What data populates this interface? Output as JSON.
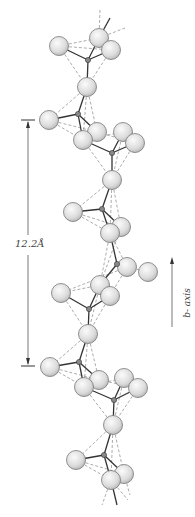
{
  "figure": {
    "scale_bar": {
      "label": "12.2Å",
      "x": 28,
      "y_top": 120,
      "y_bottom": 366
    },
    "axis": {
      "label": "b- axis",
      "x": 172,
      "y_tip": 257,
      "y_tail": 327
    },
    "colors": {
      "atom_fill": "#e2e2e2",
      "atom_stroke": "#777777",
      "bond": "#333333",
      "dash": "#888888",
      "text": "#444444"
    },
    "large_atoms": [
      [
        59,
        46
      ],
      [
        99,
        38
      ],
      [
        111,
        50
      ],
      [
        87,
        87
      ],
      [
        49,
        120
      ],
      [
        97,
        132
      ],
      [
        83,
        140
      ],
      [
        123,
        132
      ],
      [
        135,
        143
      ],
      [
        112,
        180
      ],
      [
        73,
        212
      ],
      [
        121,
        227
      ],
      [
        110,
        233
      ],
      [
        127,
        267
      ],
      [
        148,
        272
      ],
      [
        100,
        285
      ],
      [
        110,
        296
      ],
      [
        61,
        293
      ],
      [
        88,
        334
      ],
      [
        50,
        367
      ],
      [
        99,
        380
      ],
      [
        84,
        387
      ],
      [
        124,
        378
      ],
      [
        138,
        388
      ],
      [
        113,
        425
      ],
      [
        76,
        460
      ],
      [
        124,
        474
      ],
      [
        111,
        480
      ]
    ],
    "small_atoms": [
      [
        88,
        60
      ],
      [
        78,
        114
      ],
      [
        112,
        153
      ],
      [
        102,
        209
      ],
      [
        117,
        264
      ],
      [
        89,
        309
      ],
      [
        79,
        362
      ],
      [
        114,
        400
      ],
      [
        104,
        455
      ]
    ],
    "bonds": [
      [
        88,
        60,
        59,
        46
      ],
      [
        88,
        60,
        99,
        38
      ],
      [
        88,
        60,
        111,
        50
      ],
      [
        88,
        60,
        87,
        87
      ],
      [
        78,
        114,
        87,
        87
      ],
      [
        78,
        114,
        49,
        120
      ],
      [
        78,
        114,
        83,
        140
      ],
      [
        78,
        114,
        97,
        132
      ],
      [
        112,
        153,
        83,
        140
      ],
      [
        112,
        153,
        123,
        132
      ],
      [
        112,
        153,
        135,
        143
      ],
      [
        112,
        153,
        112,
        180
      ],
      [
        102,
        209,
        112,
        180
      ],
      [
        102,
        209,
        73,
        212
      ],
      [
        102,
        209,
        121,
        227
      ],
      [
        102,
        209,
        110,
        233
      ],
      [
        117,
        264,
        110,
        233
      ],
      [
        117,
        264,
        127,
        267
      ],
      [
        117,
        264,
        100,
        285
      ],
      [
        89,
        309,
        100,
        285
      ],
      [
        89,
        309,
        61,
        293
      ],
      [
        89,
        309,
        110,
        296
      ],
      [
        89,
        309,
        88,
        334
      ],
      [
        79,
        362,
        88,
        334
      ],
      [
        79,
        362,
        50,
        367
      ],
      [
        79,
        362,
        84,
        387
      ],
      [
        79,
        362,
        99,
        380
      ],
      [
        114,
        400,
        84,
        387
      ],
      [
        114,
        400,
        124,
        378
      ],
      [
        114,
        400,
        138,
        388
      ],
      [
        114,
        400,
        113,
        425
      ],
      [
        104,
        455,
        113,
        425
      ],
      [
        104,
        455,
        76,
        460
      ],
      [
        104,
        455,
        124,
        474
      ],
      [
        104,
        455,
        111,
        480
      ],
      [
        99,
        38,
        110,
        18
      ],
      [
        111,
        480,
        117,
        505
      ]
    ],
    "dashes": [
      [
        59,
        46,
        99,
        38
      ],
      [
        59,
        46,
        111,
        50
      ],
      [
        59,
        46,
        87,
        87
      ],
      [
        111,
        50,
        87,
        87
      ],
      [
        99,
        38,
        100,
        10
      ],
      [
        99,
        38,
        125,
        28
      ],
      [
        87,
        87,
        49,
        120
      ],
      [
        87,
        87,
        83,
        140
      ],
      [
        87,
        87,
        97,
        132
      ],
      [
        49,
        120,
        83,
        140
      ],
      [
        49,
        120,
        97,
        132
      ],
      [
        83,
        140,
        123,
        132
      ],
      [
        97,
        132,
        135,
        143
      ],
      [
        83,
        140,
        112,
        180
      ],
      [
        135,
        143,
        112,
        180
      ],
      [
        123,
        132,
        112,
        180
      ],
      [
        112,
        180,
        73,
        212
      ],
      [
        112,
        180,
        121,
        227
      ],
      [
        112,
        180,
        110,
        233
      ],
      [
        73,
        212,
        110,
        233
      ],
      [
        73,
        212,
        121,
        227
      ],
      [
        110,
        233,
        127,
        267
      ],
      [
        121,
        227,
        100,
        285
      ],
      [
        110,
        233,
        100,
        285
      ],
      [
        127,
        267,
        148,
        272
      ],
      [
        127,
        267,
        61,
        293
      ],
      [
        100,
        285,
        61,
        293
      ],
      [
        127,
        267,
        110,
        296
      ],
      [
        61,
        293,
        88,
        334
      ],
      [
        110,
        296,
        88,
        334
      ],
      [
        100,
        285,
        88,
        334
      ],
      [
        88,
        334,
        50,
        367
      ],
      [
        88,
        334,
        84,
        387
      ],
      [
        88,
        334,
        99,
        380
      ],
      [
        50,
        367,
        84,
        387
      ],
      [
        50,
        367,
        99,
        380
      ],
      [
        84,
        387,
        124,
        378
      ],
      [
        99,
        380,
        138,
        388
      ],
      [
        84,
        387,
        113,
        425
      ],
      [
        138,
        388,
        113,
        425
      ],
      [
        124,
        378,
        113,
        425
      ],
      [
        113,
        425,
        76,
        460
      ],
      [
        113,
        425,
        124,
        474
      ],
      [
        113,
        425,
        111,
        480
      ],
      [
        76,
        460,
        111,
        480
      ],
      [
        76,
        460,
        124,
        474
      ],
      [
        111,
        480,
        102,
        505
      ],
      [
        111,
        480,
        128,
        500
      ],
      [
        124,
        474,
        130,
        495
      ]
    ]
  }
}
